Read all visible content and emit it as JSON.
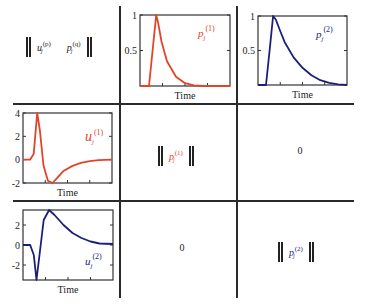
{
  "colors": {
    "series1": "#e0452a",
    "series2": "#1c1f7a",
    "grid": "#2a2a2a",
    "text": "#222222"
  },
  "header_cell": {
    "left_symbol_base": "u",
    "left_symbol_sub": "j",
    "left_symbol_sup": "(p)",
    "right_symbol_base": "p",
    "right_symbol_sub": "j",
    "right_symbol_sup": "(q)"
  },
  "cells": {
    "r1c1_symbol": {
      "base": "p",
      "sub": "j",
      "sup": "(1)"
    },
    "r1c2_value": "0",
    "r2c1_value": "0",
    "r2c2_symbol": {
      "base": "p",
      "sub": "j",
      "sup": "(2)"
    }
  },
  "chart_data": [
    {
      "id": "p1",
      "type": "line",
      "title": "",
      "legend_label": {
        "base": "p",
        "sub": "j",
        "sup": "(1)"
      },
      "xlabel": "Time",
      "ylabel": "",
      "yticks": [
        "1",
        "0.5"
      ],
      "ylim": [
        0,
        1
      ],
      "color": "#e0452a",
      "x": [
        0,
        0.1,
        0.14,
        0.18,
        0.2,
        0.24,
        0.3,
        0.4,
        0.5,
        0.6,
        0.7,
        1.0
      ],
      "values": [
        0,
        0,
        0.5,
        1.0,
        0.9,
        0.62,
        0.35,
        0.13,
        0.04,
        0.01,
        0,
        0
      ]
    },
    {
      "id": "p2",
      "type": "line",
      "title": "",
      "legend_label": {
        "base": "p",
        "sub": "j",
        "sup": "(2)"
      },
      "xlabel": "Time",
      "ylabel": "",
      "yticks": [
        "1",
        "0.5"
      ],
      "ylim": [
        0,
        1
      ],
      "color": "#1c1f7a",
      "x": [
        0,
        0.09,
        0.13,
        0.17,
        0.2,
        0.25,
        0.3,
        0.4,
        0.5,
        0.6,
        0.7,
        0.8,
        0.9,
        1.0
      ],
      "values": [
        0,
        0,
        0.5,
        1.0,
        0.95,
        0.78,
        0.62,
        0.4,
        0.25,
        0.14,
        0.07,
        0.03,
        0.01,
        0
      ]
    },
    {
      "id": "u1",
      "type": "line",
      "title": "",
      "legend_label": {
        "base": "u",
        "sub": "j",
        "sup": "(1)"
      },
      "xlabel": "Time",
      "ylabel": "",
      "yticks": [
        "4",
        "2",
        "0",
        "-2"
      ],
      "ylim": [
        -2,
        4
      ],
      "color": "#e0452a",
      "x": [
        0,
        0.08,
        0.12,
        0.16,
        0.19,
        0.23,
        0.28,
        0.33,
        0.38,
        0.45,
        0.55,
        0.65,
        0.75,
        0.85,
        1.0
      ],
      "values": [
        0,
        0,
        0.5,
        4.0,
        2.5,
        -0.5,
        -1.8,
        -2.0,
        -1.6,
        -1.0,
        -0.55,
        -0.28,
        -0.12,
        -0.04,
        0
      ]
    },
    {
      "id": "u2",
      "type": "line",
      "title": "",
      "legend_label": {
        "base": "u",
        "sub": "j",
        "sup": "(2)"
      },
      "xlabel": "Time",
      "ylabel": "",
      "yticks": [
        "2",
        "0",
        "-2"
      ],
      "ylim": [
        -3.5,
        3.5
      ],
      "color": "#1c1f7a",
      "x": [
        0,
        0.08,
        0.12,
        0.15,
        0.19,
        0.23,
        0.29,
        0.35,
        0.45,
        0.55,
        0.65,
        0.75,
        0.85,
        1.0
      ],
      "values": [
        0,
        0,
        -1.0,
        -3.5,
        -0.5,
        2.5,
        3.5,
        3.0,
        2.0,
        1.2,
        0.7,
        0.35,
        0.15,
        0.1
      ]
    }
  ]
}
